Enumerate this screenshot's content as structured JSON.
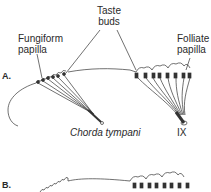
{
  "figure": {
    "panel_a": {
      "label": "A.",
      "taste_buds_line1": "Taste",
      "taste_buds_line2": "buds",
      "fungiform_line1": "Fungiform",
      "fungiform_line2": "papilla",
      "folliate_line1": "Folliate",
      "folliate_line2": "papilla",
      "chorda_tympani": "Chorda tympani",
      "nerve_ix": "IX"
    },
    "panel_b": {
      "label": "B."
    },
    "colors": {
      "line": "#333333",
      "text": "#2a2a2a",
      "background": "#ffffff"
    }
  }
}
